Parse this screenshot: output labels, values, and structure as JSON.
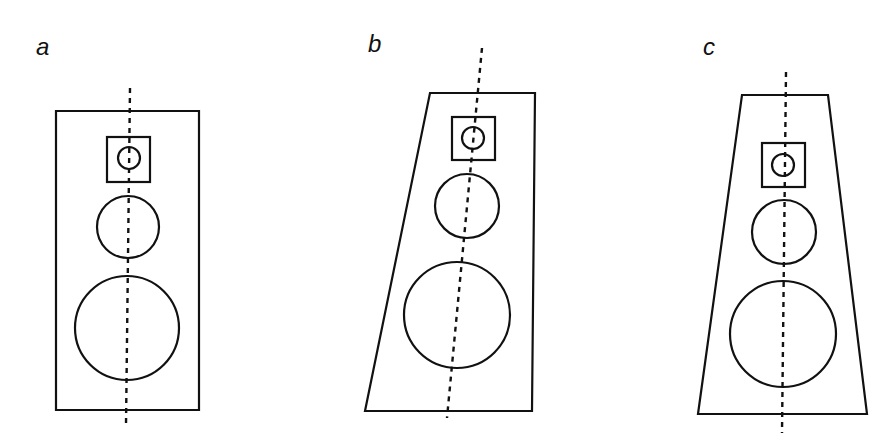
{
  "figure": {
    "panels": [
      {
        "label": "a",
        "label_pos": [
          36,
          55
        ],
        "cabinet": "rectangle",
        "cabinet_points": "56,111 199,111 199,410 56,410",
        "tweeter_box": {
          "x": 107,
          "y": 137,
          "w": 43,
          "h": 45
        },
        "tweeter": {
          "cx": 129,
          "cy": 158,
          "r": 11
        },
        "midrange": {
          "cx": 128,
          "cy": 227,
          "r": 31
        },
        "woofer": {
          "cx": 127,
          "cy": 328,
          "r": 52
        },
        "axis_line": {
          "x1": 130,
          "y1": 88,
          "x2": 126,
          "y2": 425
        }
      },
      {
        "label": "b",
        "label_pos": [
          368,
          52
        ],
        "cabinet": "trapezoid-slanted",
        "cabinet_points": "430,93 535,93 532,411 365,411",
        "tweeter_box": {
          "x": 452,
          "y": 117,
          "w": 43,
          "h": 43
        },
        "tweeter": {
          "cx": 473,
          "cy": 138,
          "r": 11
        },
        "midrange": {
          "cx": 467,
          "cy": 206,
          "r": 32
        },
        "woofer": {
          "cx": 457,
          "cy": 315,
          "r": 53
        },
        "axis_line": {
          "x1": 482,
          "y1": 48,
          "x2": 447,
          "y2": 418
        }
      },
      {
        "label": "c",
        "label_pos": [
          703,
          55
        ],
        "cabinet": "trapezoid-symmetric",
        "cabinet_points": "742,95 828,95 867,414 698,414",
        "tweeter_box": {
          "x": 762,
          "y": 143,
          "w": 43,
          "h": 44
        },
        "tweeter": {
          "cx": 783,
          "cy": 165,
          "r": 11
        },
        "midrange": {
          "cx": 784,
          "cy": 232,
          "r": 32
        },
        "woofer": {
          "cx": 783,
          "cy": 334,
          "r": 53
        },
        "axis_line": {
          "x1": 786,
          "y1": 72,
          "x2": 782,
          "y2": 433
        }
      }
    ]
  }
}
